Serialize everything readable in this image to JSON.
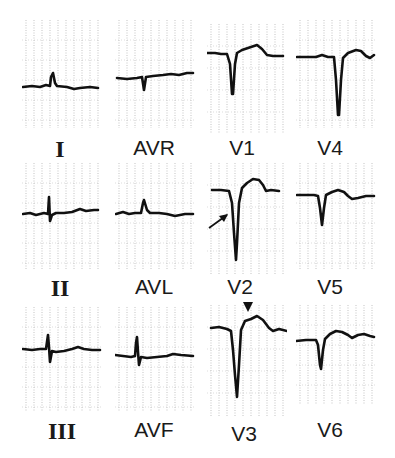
{
  "figure": {
    "leads": [
      {
        "id": "I",
        "label": "I",
        "style": "roman"
      },
      {
        "id": "AVR",
        "label": "AVR",
        "style": "sans"
      },
      {
        "id": "V1",
        "label": "V1",
        "style": "sans"
      },
      {
        "id": "V4",
        "label": "V4",
        "style": "sans"
      },
      {
        "id": "II",
        "label": "II",
        "style": "roman"
      },
      {
        "id": "AVL",
        "label": "AVL",
        "style": "sans"
      },
      {
        "id": "V2",
        "label": "V2",
        "style": "sans"
      },
      {
        "id": "V5",
        "label": "V5",
        "style": "sans"
      },
      {
        "id": "III",
        "label": "III",
        "style": "roman"
      },
      {
        "id": "AVF",
        "label": "AVF",
        "style": "sans"
      },
      {
        "id": "V3",
        "label": "V3",
        "style": "sans"
      },
      {
        "id": "V6",
        "label": "V6",
        "style": "sans"
      }
    ],
    "annotations": [
      {
        "type": "arrow",
        "lead": "V2",
        "description": "arrow pointing to descending QS complex"
      },
      {
        "type": "arrowhead-marker",
        "lead": "V3",
        "description": "downward triangle marker above ST segment"
      }
    ],
    "colors": {
      "trace": "#111111",
      "grid": "#9a9a9a",
      "background": "#ffffff"
    }
  }
}
